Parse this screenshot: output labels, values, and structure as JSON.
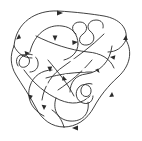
{
  "figure": {
    "type": "knot-diagram",
    "symmetry": "3-fold rotational",
    "background_color": "#ffffff",
    "stroke_color": "#2b2b2b",
    "stroke_width": 0.9,
    "canvas": {
      "width": 142,
      "height": 141
    },
    "center": {
      "x": 71,
      "y": 70
    },
    "labels": []
  },
  "chart_data": {
    "type": "diagram",
    "xlabel": "",
    "ylabel": "",
    "xlim": [
      0,
      142
    ],
    "ylim": [
      0,
      141
    ],
    "grid": false,
    "legend": "none",
    "components": {
      "lobes": 3,
      "curls": 3,
      "arrow_markers": 14
    },
    "curls": [
      {
        "name": "curl-top-right",
        "cx": 88,
        "cy": 28,
        "r1": 7,
        "r2": 6
      },
      {
        "name": "curl-left",
        "cx": 26,
        "cy": 58,
        "r1": 7,
        "r2": 6
      },
      {
        "name": "curl-bottom-right",
        "cx": 84,
        "cy": 96,
        "r1": 7,
        "r2": 6
      }
    ],
    "arrows": [
      {
        "x": 63,
        "y": 13,
        "angle": 0
      },
      {
        "x": 19,
        "y": 34,
        "angle": 55
      },
      {
        "x": 126,
        "y": 35,
        "angle": 118
      },
      {
        "x": 55,
        "y": 41,
        "angle": 95
      },
      {
        "x": 78,
        "y": 42,
        "angle": 5
      },
      {
        "x": 30,
        "y": 53,
        "angle": 20
      },
      {
        "x": 110,
        "y": 57,
        "angle": 200
      },
      {
        "x": 50,
        "y": 72,
        "angle": 85
      },
      {
        "x": 95,
        "y": 70,
        "angle": 140
      },
      {
        "x": 67,
        "y": 80,
        "angle": 230
      },
      {
        "x": 30,
        "y": 100,
        "angle": 300
      },
      {
        "x": 112,
        "y": 92,
        "angle": 105
      },
      {
        "x": 72,
        "y": 128,
        "angle": 180
      },
      {
        "x": 44,
        "y": 110,
        "angle": 330
      }
    ]
  }
}
